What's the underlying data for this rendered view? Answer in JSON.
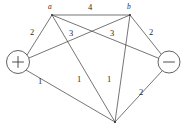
{
  "figure": {
    "width": 188,
    "height": 133,
    "background_color": "#ffffff",
    "line_color": "#3a3a3a"
  },
  "nodes": [
    {
      "id": "source",
      "label": "+",
      "kind": "terminal-circle",
      "x": 18,
      "y": 62,
      "radius": 11.5
    },
    {
      "id": "a",
      "label": "a",
      "kind": "junction",
      "x": 52,
      "y": 15,
      "label_x": 48,
      "label_y": 3
    },
    {
      "id": "b",
      "label": "b",
      "kind": "junction",
      "x": 130,
      "y": 15,
      "label_x": 127,
      "label_y": 3
    },
    {
      "id": "sink",
      "label": "−",
      "kind": "terminal-circle",
      "x": 169,
      "y": 62,
      "radius": 11.0
    },
    {
      "id": "bottom",
      "label": "",
      "kind": "junction",
      "x": 115,
      "y": 122,
      "label_x": 0,
      "label_y": 0
    }
  ],
  "edges": [
    {
      "id": "source-a",
      "from": "source",
      "to": "a",
      "weight": "2",
      "x1": 27,
      "y1": 55,
      "x2": 52,
      "y2": 15,
      "label_x": 30,
      "label_y": 28
    },
    {
      "id": "a-b",
      "from": "a",
      "to": "b",
      "weight": "4",
      "x1": 52,
      "y1": 15,
      "x2": 130,
      "y2": 15,
      "label_x": 88,
      "label_y": 3
    },
    {
      "id": "b-sink",
      "from": "b",
      "to": "sink",
      "weight": "2",
      "x1": 130,
      "y1": 15,
      "x2": 161,
      "y2": 54,
      "label_x": 149,
      "label_y": 28
    },
    {
      "id": "a-sink",
      "from": "a",
      "to": "sink",
      "weight": "3",
      "x1": 52,
      "y1": 15,
      "x2": 158,
      "y2": 58,
      "label_x": 69,
      "label_y": 29
    },
    {
      "id": "source-b",
      "from": "source",
      "to": "b",
      "weight": "3",
      "x1": 29,
      "y1": 58,
      "x2": 130,
      "y2": 15,
      "label_x": 110,
      "label_y": 29
    },
    {
      "id": "source-bottom",
      "from": "source",
      "to": "bottom",
      "weight": "1",
      "x1": 26,
      "y1": 70,
      "x2": 115,
      "y2": 122,
      "label_x": 38,
      "label_y": 77
    },
    {
      "id": "a-bottom",
      "from": "a",
      "to": "bottom",
      "weight": "1",
      "x1": 52,
      "y1": 15,
      "x2": 115,
      "y2": 122,
      "label_x": 77,
      "label_y": 75
    },
    {
      "id": "b-bottom",
      "from": "b",
      "to": "bottom",
      "weight": "1",
      "x1": 130,
      "y1": 15,
      "x2": 115,
      "y2": 122,
      "label_x": 107,
      "label_y": 75
    },
    {
      "id": "sink-bottom",
      "from": "sink",
      "to": "bottom",
      "weight": "2",
      "x1": 162,
      "y1": 71,
      "x2": 115,
      "y2": 122,
      "label_x": 139,
      "label_y": 88
    }
  ]
}
